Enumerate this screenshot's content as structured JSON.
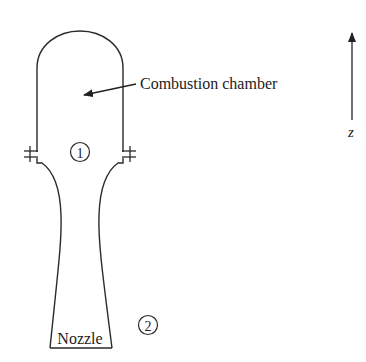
{
  "diagram": {
    "type": "rocket-engine-schematic",
    "labels": {
      "combustion_chamber": "Combustion chamber",
      "nozzle": "Nozzle",
      "station_1": "1",
      "station_2": "2",
      "axis": "z"
    },
    "colors": {
      "stroke": "#2a2a2a",
      "text": "#222222",
      "background": "#ffffff"
    }
  }
}
